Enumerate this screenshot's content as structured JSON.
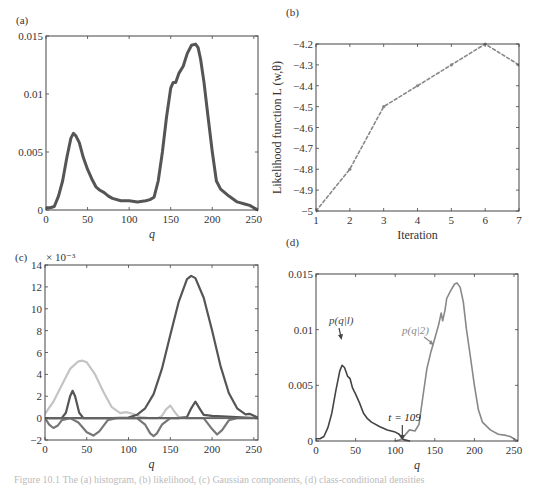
{
  "figure": {
    "caption_fragment": "Figure 10.1  The (a) histogram, (b) likelihood, (c) Gaussian components, (d) class-conditional densities"
  },
  "chart_data": [
    {
      "id": "a",
      "panel_label": "(a)",
      "type": "line",
      "title": "",
      "xlabel": "q",
      "ylabel": "",
      "xlim": [
        0,
        255
      ],
      "ylim": [
        0,
        0.015
      ],
      "xticks": [
        0,
        50,
        100,
        150,
        200,
        250
      ],
      "yticks": [
        0,
        0.005,
        0.01,
        0.015
      ],
      "ytick_labels": [
        "0",
        "0.005",
        "0.01",
        "0.015"
      ],
      "grid": false,
      "frame": {
        "x0": 46,
        "y0": 36,
        "x1": 258,
        "y1": 210
      },
      "series": [
        {
          "name": "histogram",
          "color": "#555555",
          "width": 3,
          "x": [
            0,
            5,
            10,
            15,
            20,
            25,
            30,
            33,
            36,
            40,
            45,
            50,
            55,
            60,
            65,
            70,
            75,
            80,
            90,
            100,
            110,
            120,
            125,
            130,
            135,
            140,
            145,
            150,
            153,
            156,
            160,
            165,
            170,
            175,
            180,
            183,
            186,
            190,
            195,
            200,
            205,
            210,
            220,
            230,
            240,
            245,
            250,
            255
          ],
          "y": [
            0.0002,
            0.0002,
            0.0003,
            0.0012,
            0.0025,
            0.0045,
            0.0062,
            0.0066,
            0.0064,
            0.0058,
            0.0045,
            0.0035,
            0.0027,
            0.002,
            0.0017,
            0.0015,
            0.0012,
            0.001,
            0.0008,
            0.0008,
            0.0007,
            0.0008,
            0.0009,
            0.0011,
            0.0025,
            0.005,
            0.008,
            0.0105,
            0.011,
            0.011,
            0.0118,
            0.0124,
            0.0135,
            0.0142,
            0.0143,
            0.014,
            0.013,
            0.011,
            0.008,
            0.005,
            0.0025,
            0.0018,
            0.0012,
            0.0007,
            0.0005,
            0.0004,
            0.0002,
            0.0
          ]
        }
      ]
    },
    {
      "id": "b",
      "panel_label": "(b)",
      "type": "line",
      "title": "",
      "xlabel": "Iteration",
      "ylabel": "Likelihood function L (w,θ)",
      "xlim": [
        1,
        7
      ],
      "ylim": [
        -5,
        -4.2
      ],
      "xticks": [
        1,
        2,
        3,
        4,
        5,
        6,
        7
      ],
      "yticks": [
        -5,
        -4.9,
        -4.8,
        -4.7,
        -4.6,
        -4.5,
        -4.4,
        -4.3,
        -4.2
      ],
      "ytick_labels": [
        "−5",
        "−4.9",
        "−4.8",
        "−4.7",
        "−4.6",
        "−4.5",
        "−4.4",
        "−4.3",
        "−4.2"
      ],
      "grid": false,
      "frame": {
        "x0": 316,
        "y0": 44,
        "x1": 519,
        "y1": 211
      },
      "series": [
        {
          "name": "likelihood",
          "color": "#888888",
          "width": 1.6,
          "dashed": true,
          "markers": true,
          "x": [
            1,
            2,
            3,
            4,
            5,
            6,
            7
          ],
          "y": [
            -5.0,
            -4.8,
            -4.5,
            -4.4,
            -4.3,
            -4.2,
            -4.3
          ]
        }
      ]
    },
    {
      "id": "c",
      "panel_label": "(c)",
      "type": "line",
      "title": "",
      "xlabel": "q",
      "ylabel": "",
      "y_scale_note": "× 10⁻³",
      "xlim": [
        0,
        255
      ],
      "ylim": [
        -2,
        14
      ],
      "xticks": [
        0,
        50,
        100,
        150,
        200,
        250
      ],
      "yticks": [
        -2,
        0,
        2,
        4,
        6,
        8,
        10,
        12,
        14
      ],
      "ytick_labels": [
        "−2",
        "0",
        "2",
        "4",
        "6",
        "8",
        "10",
        "12",
        "14"
      ],
      "grid": false,
      "frame": {
        "x0": 45,
        "y0": 265,
        "x1": 258,
        "y1": 440
      },
      "series": [
        {
          "name": "component-light",
          "color": "#c4c4c4",
          "width": 2.2,
          "x": [
            0,
            10,
            20,
            30,
            40,
            45,
            50,
            60,
            70,
            80,
            90,
            97,
            105,
            115,
            125,
            135,
            140,
            145,
            150,
            155,
            160,
            170,
            180,
            200,
            220,
            240,
            255
          ],
          "y": [
            0.4,
            1.5,
            3.0,
            4.5,
            5.2,
            5.25,
            5.1,
            4.0,
            2.4,
            1.0,
            0.45,
            0.55,
            0.4,
            0.1,
            0.0,
            0.0,
            0.2,
            0.8,
            1.15,
            0.6,
            0.1,
            0.0,
            0.0,
            0.0,
            0.0,
            0.0,
            0.0
          ]
        },
        {
          "name": "component-dark-large",
          "color": "#555555",
          "width": 2.2,
          "x": [
            0,
            80,
            100,
            110,
            120,
            130,
            140,
            150,
            160,
            170,
            175,
            180,
            190,
            200,
            210,
            220,
            230,
            240,
            245,
            255
          ],
          "y": [
            0,
            0,
            0.05,
            0.3,
            0.9,
            2.2,
            4.5,
            7.6,
            10.6,
            12.7,
            13.0,
            12.8,
            11.0,
            8.0,
            4.8,
            2.3,
            0.9,
            0.35,
            0.4,
            0.05
          ]
        },
        {
          "name": "component-dark-small",
          "color": "#555555",
          "width": 2.2,
          "x": [
            0,
            20,
            25,
            30,
            33,
            36,
            41,
            46,
            60,
            160,
            170,
            175,
            180,
            185,
            190,
            200,
            255
          ],
          "y": [
            0,
            0,
            0.5,
            2.0,
            2.5,
            2.0,
            0.5,
            0,
            0,
            0,
            0.1,
            0.9,
            1.5,
            0.9,
            0.3,
            0.2,
            0.0
          ]
        },
        {
          "name": "component-negative",
          "color": "#777777",
          "width": 2.2,
          "x": [
            0,
            5,
            10,
            15,
            20,
            30,
            40,
            50,
            58,
            65,
            75,
            85,
            110,
            120,
            126,
            130,
            134,
            140,
            150,
            190,
            200,
            206,
            212,
            220,
            230,
            255
          ],
          "y": [
            0,
            -0.6,
            -0.9,
            -0.7,
            -0.2,
            0,
            -0.4,
            -1.3,
            -1.6,
            -1.2,
            -0.2,
            0,
            0,
            -0.6,
            -1.4,
            -1.65,
            -1.4,
            -0.6,
            0,
            0,
            -1.0,
            -1.5,
            -1.1,
            -0.2,
            0,
            0
          ]
        },
        {
          "name": "baseline",
          "color": "#666666",
          "width": 1.6,
          "x": [
            0,
            255
          ],
          "y": [
            0,
            0
          ]
        }
      ]
    },
    {
      "id": "d",
      "panel_label": "(d)",
      "type": "line",
      "title": "",
      "xlabel": "q",
      "ylabel": "",
      "xlim": [
        0,
        255
      ],
      "ylim": [
        0,
        0.015
      ],
      "xticks": [
        0,
        50,
        100,
        150,
        200,
        250
      ],
      "yticks": [
        0,
        0.005,
        0.01,
        0.015
      ],
      "ytick_labels": [
        "0",
        "0.005",
        "0.01",
        "0.015"
      ],
      "grid": false,
      "frame": {
        "x0": 316,
        "y0": 274,
        "x1": 518,
        "y1": 441
      },
      "threshold": {
        "value": 109,
        "label": "t = 109"
      },
      "annotations": [
        {
          "text": "p(q|l)",
          "x": 329,
          "y": 324,
          "color": "#444444"
        },
        {
          "text": "p(q|2)",
          "x": 402,
          "y": 334,
          "color": "#888888"
        }
      ],
      "series": [
        {
          "name": "p(q|1)",
          "color": "#444444",
          "width": 1.6,
          "x": [
            0,
            5,
            10,
            15,
            20,
            25,
            30,
            33,
            36,
            40,
            43,
            46,
            50,
            55,
            60,
            65,
            70,
            80,
            90,
            100,
            105,
            109,
            112,
            118
          ],
          "y": [
            0.0002,
            0.0002,
            0.0004,
            0.0012,
            0.0025,
            0.0045,
            0.0063,
            0.0068,
            0.0066,
            0.0058,
            0.0056,
            0.0048,
            0.0042,
            0.0034,
            0.0025,
            0.002,
            0.0017,
            0.0013,
            0.001,
            0.0008,
            0.0006,
            0.0002,
            0.0001,
            0.0
          ]
        },
        {
          "name": "p(q|2)",
          "color": "#888888",
          "width": 1.6,
          "x": [
            100,
            105,
            109,
            112,
            118,
            125,
            130,
            135,
            140,
            145,
            150,
            155,
            158,
            160,
            163,
            165,
            170,
            175,
            178,
            182,
            186,
            190,
            195,
            200,
            205,
            210,
            220,
            230,
            240,
            245,
            250,
            255
          ],
          "y": [
            0.0,
            0.0001,
            0.0002,
            0.0005,
            0.001,
            0.0009,
            0.0015,
            0.004,
            0.0065,
            0.008,
            0.0092,
            0.0105,
            0.0115,
            0.0108,
            0.0118,
            0.0128,
            0.0135,
            0.0141,
            0.0142,
            0.0138,
            0.0125,
            0.01,
            0.0075,
            0.005,
            0.0028,
            0.0017,
            0.001,
            0.0006,
            0.0005,
            0.0004,
            0.0002,
            0.0
          ]
        }
      ]
    }
  ]
}
